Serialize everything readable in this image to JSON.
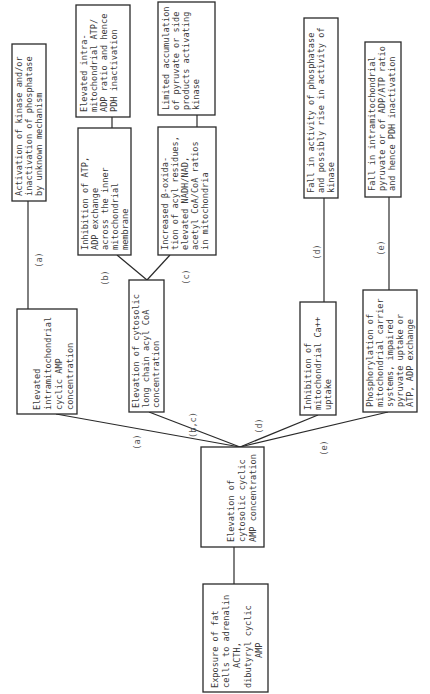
{
  "diagram": {
    "orientation": "rotated 90 degrees counter-clockwise",
    "nodes": {
      "exposure": {
        "lines": [
          "Exposure of fat",
          "cells to adrenalin",
          "ACTH,",
          "dibutyryl cyclic",
          "AMP"
        ]
      },
      "cytosolic_camp": {
        "lines": [
          "Elevation of",
          "cytosolic cyclic",
          "AMP concentration"
        ]
      },
      "intramito_camp": {
        "lines": [
          "Elevated",
          "intramitochondrial",
          "cyclic AMP",
          "concentration"
        ]
      },
      "acyl_coa": {
        "lines": [
          "Elevation of cytosolic",
          "long chain acyl CoA",
          "concentration"
        ]
      },
      "ca_uptake": {
        "lines": [
          "Inhibition of",
          "mitochondrial Ca++",
          "uptake"
        ]
      },
      "phosphorylation": {
        "lines": [
          "Phosphorylation of",
          "mitochondrial carrier",
          "systems, impaired",
          "pyruvate uptake or",
          "ATP, ADP exchange"
        ]
      },
      "kinase_activation": {
        "lines": [
          "Activation of kinase and/or",
          "inactivation of phosphatase",
          "by unknown mechanism"
        ]
      },
      "atp_adp_inhibition": {
        "lines": [
          "Inhibition of ATP,",
          "ADP exchange",
          "across the inner",
          "mitochondrial",
          "membrane"
        ]
      },
      "atp_adp_ratio": {
        "lines": [
          "Elevated intra-",
          "mitochondrial ATP/",
          "ADP ratio and hence",
          "PDH inactivation"
        ]
      },
      "beta_oxidation": {
        "lines": [
          "Increased β-oxida-",
          "tion of acyl residues,",
          "elevated NADH/NAD,",
          "acetyl CoA/CoA ratios",
          "in mitochondria"
        ]
      },
      "pyruvate_accumulation": {
        "lines": [
          "Limited accumulation",
          "of pyruvate or side",
          "products activating",
          "kinase"
        ]
      },
      "phosphatase_fall": {
        "lines": [
          "Fall in activity of phosphatase",
          "and possibly rise in activity of",
          "kinase"
        ]
      },
      "pyruvate_fall": {
        "lines": [
          "Fall in intramitochondrial",
          "pyruvate or of ADP/ATP ratio",
          "and hence PDH inactivation"
        ]
      }
    },
    "edge_labels": {
      "a1": "(a)",
      "a2": "(a)",
      "bc": "(b,c)",
      "b": "(b)",
      "c": "(c)",
      "d1": "(d)",
      "d2": "(d)",
      "e1": "(e)",
      "e2": "(e)"
    },
    "colors": {
      "line": "#2a2a2a",
      "text": "#3a3a3a",
      "background": "#ffffff"
    }
  }
}
